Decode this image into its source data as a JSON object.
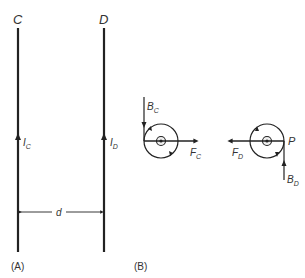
{
  "panel_a": {
    "caption": "(A)",
    "wire_c": {
      "label": "C",
      "current_label": "I",
      "current_sub": "C"
    },
    "wire_d": {
      "label": "D",
      "current_label": "I",
      "current_sub": "D"
    },
    "separation_label": "d"
  },
  "panel_b": {
    "caption": "(B)",
    "left": {
      "field_label": "B",
      "field_sub": "C",
      "force_label": "F",
      "force_sub": "C",
      "center_symbol": "⊗"
    },
    "right": {
      "point_label": "P",
      "field_label": "B",
      "field_sub": "D",
      "force_label": "F",
      "force_sub": "D",
      "center_symbol": "⊗"
    }
  },
  "colors": {
    "line": "#222222",
    "text": "#333333",
    "background": "#ffffff"
  }
}
